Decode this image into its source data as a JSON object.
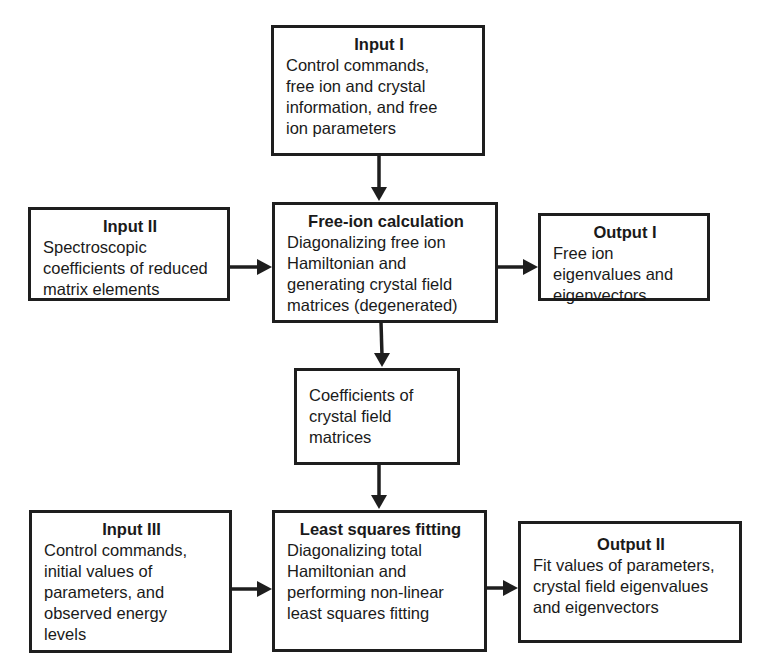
{
  "diagram": {
    "type": "flowchart",
    "nodes": {
      "input1": {
        "title": "Input I",
        "body": "Control commands,\nfree ion and crystal\ninformation, and free\nion parameters"
      },
      "input2": {
        "title": "Input II",
        "body": "Spectroscopic\ncoefficients of reduced\nmatrix elements"
      },
      "freeion": {
        "title": "Free-ion calculation",
        "body": "Diagonalizing free ion\nHamiltonian and\ngenerating crystal field\nmatrices (degenerated)"
      },
      "output1": {
        "title": "Output I",
        "body": "Free ion\neigenvalues and\neigenvectors"
      },
      "coeffs": {
        "title": "",
        "body": "Coefficients of\ncrystal field\nmatrices"
      },
      "input3": {
        "title": "Input III",
        "body": "Control commands,\ninitial values of\nparameters, and\nobserved energy\nlevels"
      },
      "lsq": {
        "title": "Least squares fitting",
        "body": "Diagonalizing total\nHamiltonian and\nperforming non-linear\nleast squares fitting"
      },
      "output2": {
        "title": "Output II",
        "body": "Fit values of parameters,\ncrystal field eigenvalues\nand eigenvectors"
      }
    },
    "edges": [
      {
        "from": "input1",
        "to": "freeion"
      },
      {
        "from": "input2",
        "to": "freeion"
      },
      {
        "from": "freeion",
        "to": "output1"
      },
      {
        "from": "freeion",
        "to": "coeffs"
      },
      {
        "from": "coeffs",
        "to": "lsq"
      },
      {
        "from": "input3",
        "to": "lsq"
      },
      {
        "from": "lsq",
        "to": "output2"
      }
    ]
  }
}
